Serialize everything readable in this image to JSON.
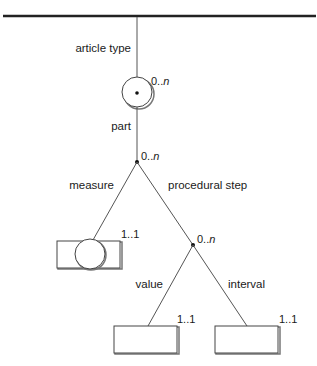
{
  "diagram": {
    "type": "tree",
    "root_bar": {
      "label": ""
    },
    "edges": {
      "article_type": {
        "label": "article type"
      },
      "part": {
        "label": "part"
      },
      "measure": {
        "label": "measure"
      },
      "procedural_step": {
        "label": "procedural step"
      },
      "value": {
        "label": "value"
      },
      "interval": {
        "label": "interval"
      }
    },
    "nodes": {
      "part_node": {
        "shape": "circle-with-dot",
        "cardinality_main": "0..",
        "cardinality_n": "n"
      },
      "part_branch": {
        "shape": "dot",
        "cardinality_main": "0..",
        "cardinality_n": "n"
      },
      "measure_node": {
        "shape": "box-with-circle",
        "cardinality": "1..1"
      },
      "step_branch": {
        "shape": "dot",
        "cardinality_main": "0..",
        "cardinality_n": "n"
      },
      "value_node": {
        "shape": "box",
        "cardinality": "1..1"
      },
      "interval_node": {
        "shape": "box",
        "cardinality": "1..1"
      }
    }
  }
}
